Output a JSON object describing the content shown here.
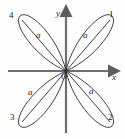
{
  "figure": {
    "type": "polar-rose-curve",
    "background": "#fdfdfd",
    "stroke_color": "#2b2b2b",
    "axis_color": "#6f6f6f"
  },
  "axes": {
    "x_label": "x",
    "y_label": "y",
    "origin_label": "O",
    "x_axis": {
      "x1": 8,
      "y1": 71,
      "x2": 112,
      "y2": 71,
      "arrow": "right"
    },
    "y_axis": {
      "x1": 66,
      "y1": 133,
      "x2": 66,
      "y2": 13,
      "arrow": "up"
    }
  },
  "origin": {
    "x": 66,
    "y": 71
  },
  "petals": [
    {
      "id": "petal-1",
      "quadrant_label": "1",
      "radial_label": "a",
      "angle_deg": 45,
      "length": 58,
      "label_pos": {
        "x": 111,
        "y": 14
      },
      "a_pos": {
        "x": 83,
        "y": 33
      }
    },
    {
      "id": "petal-2",
      "quadrant_label": "2",
      "radial_label": "a",
      "angle_deg": -45,
      "length": 58,
      "label_pos": {
        "x": 110,
        "y": 116
      },
      "a_pos": {
        "x": 88,
        "y": 88
      }
    },
    {
      "id": "petal-3",
      "quadrant_label": "3",
      "radial_label": "a",
      "angle_deg": 225,
      "length": 58,
      "label_pos": {
        "x": 11,
        "y": 116
      },
      "a_pos": {
        "x": 29,
        "y": 89
      }
    },
    {
      "id": "petal-4",
      "quadrant_label": "4",
      "radial_label": "a",
      "angle_deg": 135,
      "length": 58,
      "label_pos": {
        "x": 10,
        "y": 14
      },
      "a_pos": {
        "x": 37,
        "y": 33
      }
    }
  ],
  "axis_label_pos": {
    "x": {
      "x": 112,
      "y": 74
    },
    "y": {
      "x": 57,
      "y": 11
    },
    "origin": {
      "x": 62,
      "y": 74
    }
  }
}
